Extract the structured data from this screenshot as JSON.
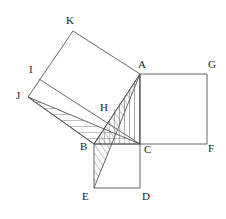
{
  "figure": {
    "background": "#ffffff",
    "stroke": "#555555",
    "hatch_color": "#777777",
    "width": 226,
    "height": 219
  },
  "points": {
    "A": {
      "label": "A",
      "x": 140,
      "y": 74,
      "lx": 138,
      "ly": 68
    },
    "B": {
      "label": "B",
      "x": 94,
      "y": 144,
      "lx": 80,
      "ly": 150
    },
    "C": {
      "label": "C",
      "x": 140,
      "y": 144,
      "lx": 144,
      "ly": 153
    },
    "D": {
      "label": "D",
      "x": 140,
      "y": 188,
      "lx": 142,
      "ly": 200
    },
    "E": {
      "label": "E",
      "x": 94,
      "y": 188,
      "lx": 82,
      "ly": 200
    },
    "F": {
      "label": "F",
      "x": 207,
      "y": 144,
      "lx": 208,
      "ly": 152
    },
    "G": {
      "label": "G",
      "x": 207,
      "y": 74,
      "lx": 208,
      "ly": 68
    },
    "H": {
      "label": "H",
      "x": 109,
      "y": 117,
      "lx": 100,
      "ly": 111
    },
    "I": {
      "label": "I",
      "x": 39,
      "y": 79,
      "lx": 29,
      "ly": 73
    },
    "J": {
      "label": "J",
      "x": 28,
      "y": 97,
      "lx": 16,
      "ly": 99
    },
    "K": {
      "label": "K",
      "x": 73,
      "y": 31,
      "lx": 66,
      "ly": 24
    }
  },
  "shapes": {
    "square_acfg": {
      "name": "square on AC",
      "vertices": [
        "A",
        "G",
        "F",
        "C"
      ]
    },
    "square_bcde": {
      "name": "square on BC",
      "vertices": [
        "B",
        "C",
        "D",
        "E"
      ]
    },
    "square_akjb": {
      "name": "square on AB",
      "vertices": [
        "A",
        "K",
        "J",
        "B"
      ]
    },
    "segment_ij": {
      "name": "segment I to C",
      "from": "I",
      "to": "C"
    },
    "segment_ae": {
      "name": "segment A to E",
      "from": "A",
      "to": "E"
    },
    "segment_jc": {
      "name": "segment J to C",
      "from": "J",
      "to": "C"
    },
    "segment_jb": {
      "name": "segment J to B",
      "from": "J",
      "to": "B"
    },
    "segment_ab": {
      "name": "segment A to B",
      "from": "A",
      "to": "B"
    },
    "segment_ac": {
      "name": "segment A to C",
      "from": "A",
      "to": "C"
    },
    "segment_bc": {
      "name": "segment B to C",
      "from": "B",
      "to": "C"
    }
  },
  "hatched_regions": [
    {
      "name": "triangle-JBC",
      "vertices": [
        "J",
        "B",
        "C"
      ]
    },
    {
      "name": "triangle-ABC",
      "vertices": [
        "A",
        "B",
        "C"
      ]
    },
    {
      "name": "triangle-ABE",
      "vertices": [
        "A",
        "B",
        "E"
      ]
    },
    {
      "name": "triangle-AHC",
      "vertices": [
        "A",
        "H",
        "C"
      ]
    }
  ]
}
